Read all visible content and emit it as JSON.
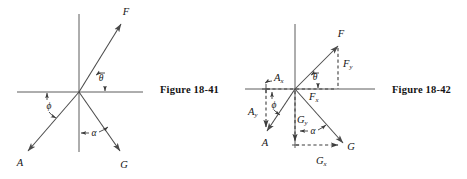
{
  "page": {
    "background_color": "#ffffff",
    "ink_color": "#141414",
    "line_color": "#4a4a4a",
    "width": 467,
    "height": 179
  },
  "figures": [
    {
      "id": "figure-18-41",
      "caption": "Figure 18-41",
      "description": "Three vectors F, A and G drawn from a common origin on x-y axes with angles theta, phi and alpha marked",
      "origin": {
        "x": 79,
        "y": 92
      },
      "axes": {
        "x_axis": {
          "x1": 17,
          "y1": 92,
          "x2": 143,
          "y2": 92
        },
        "y_axis": {
          "x1": 79,
          "y1": 14,
          "x2": 79,
          "y2": 152
        }
      },
      "vectors": [
        {
          "name": "F",
          "label": "F",
          "tip": {
            "x": 121,
            "y": 24
          },
          "label_pos": {
            "x": 126,
            "y": 15
          }
        },
        {
          "name": "A",
          "label": "A",
          "tip": {
            "x": 28,
            "y": 151
          },
          "label_pos": {
            "x": 17,
            "y": 166
          }
        },
        {
          "name": "G",
          "label": "G",
          "tip": {
            "x": 120,
            "y": 151
          },
          "label_pos": {
            "x": 122,
            "y": 168
          }
        }
      ],
      "angles": [
        {
          "name": "theta",
          "label": "θ",
          "pos": {
            "x": 100,
            "y": 79
          },
          "between": "F and +x axis"
        },
        {
          "name": "phi",
          "label": "ϕ",
          "pos": {
            "x": 48,
            "y": 109
          },
          "between": "A and -x axis"
        },
        {
          "name": "alpha",
          "label": "α",
          "pos": {
            "x": 92,
            "y": 136
          },
          "between": "G and -y axis"
        }
      ]
    },
    {
      "id": "figure-18-42",
      "caption": "Figure 18-42",
      "description": "Same three vectors resolved into x and y components shown with dashed construction lines",
      "origin": {
        "x": 295,
        "y": 89
      },
      "axes": {
        "x_axis": {
          "x1": 245,
          "y1": 89,
          "x2": 375,
          "y2": 89
        },
        "y_axis": {
          "x1": 295,
          "y1": 24,
          "x2": 295,
          "y2": 148
        }
      },
      "vectors": [
        {
          "name": "F",
          "label": "F",
          "tip": {
            "x": 338,
            "y": 46
          },
          "label_pos": {
            "x": 341,
            "y": 36
          }
        },
        {
          "name": "A",
          "label": "A",
          "tip": {
            "x": 267,
            "y": 131
          },
          "label_pos": {
            "x": 263,
            "y": 145
          }
        },
        {
          "name": "G",
          "label": "G",
          "tip": {
            "x": 343,
            "y": 143
          },
          "label_pos": {
            "x": 348,
            "y": 149
          }
        }
      ],
      "components": [
        {
          "name": "F_y",
          "base": "F",
          "sub": "y",
          "label_pos": {
            "x": 345,
            "y": 66
          }
        },
        {
          "name": "F_x",
          "base": "F",
          "sub": "x",
          "label_pos": {
            "x": 313,
            "y": 99
          }
        },
        {
          "name": "A_y",
          "base": "A",
          "sub": "y",
          "label_pos": {
            "x": 252,
            "y": 114
          }
        },
        {
          "name": "A_x",
          "base": "A",
          "sub": "x",
          "label_pos": {
            "x": 277,
            "y": 80
          }
        },
        {
          "name": "G_y",
          "base": "G",
          "sub": "y",
          "label_pos": {
            "x": 301,
            "y": 122
          }
        },
        {
          "name": "G_x",
          "base": "G",
          "sub": "x",
          "label_pos": {
            "x": 322,
            "y": 163
          }
        }
      ],
      "angles": [
        {
          "name": "theta",
          "label": "θ",
          "pos": {
            "x": 317,
            "y": 78
          },
          "between": "F and +x axis"
        },
        {
          "name": "phi",
          "label": "ϕ",
          "pos": {
            "x": 273,
            "y": 104
          },
          "between": "A and -x axis"
        },
        {
          "name": "alpha",
          "label": "α",
          "pos": {
            "x": 313,
            "y": 131
          },
          "between": "G and -y axis"
        }
      ]
    }
  ]
}
